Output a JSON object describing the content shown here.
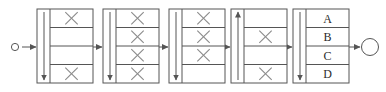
{
  "diagram": {
    "type": "linked-list-pipeline",
    "title": "",
    "canvas": {
      "width": 386,
      "height": 92
    },
    "colors": {
      "stroke": "#555555",
      "mark": "#8a8a8a",
      "background": "#ffffff",
      "text": "#2b2b2b"
    },
    "start_node": {
      "name": "start-circle",
      "label": "",
      "shape": "circle",
      "cx": 15,
      "cy": 47,
      "r": 3.6
    },
    "end_node": {
      "name": "end-circle",
      "label": "",
      "shape": "circle",
      "cx": 370,
      "cy": 47,
      "r": 8.5
    },
    "boxes": [
      {
        "id": "box-1",
        "index": 1,
        "x": 37,
        "y": 9,
        "width": 56,
        "height": 74,
        "bar": {
          "direction": "down",
          "arrow": true
        },
        "cells": [
          {
            "row": 1,
            "label": "",
            "mark": "x"
          },
          {
            "row": 2,
            "label": "",
            "mark": ""
          },
          {
            "row": 3,
            "label": "",
            "mark": ""
          },
          {
            "row": 4,
            "label": "",
            "mark": "x"
          }
        ]
      },
      {
        "id": "box-2",
        "index": 2,
        "x": 103,
        "y": 9,
        "width": 56,
        "height": 74,
        "bar": {
          "direction": "down",
          "arrow": true
        },
        "cells": [
          {
            "row": 1,
            "label": "",
            "mark": "x"
          },
          {
            "row": 2,
            "label": "",
            "mark": "x"
          },
          {
            "row": 3,
            "label": "",
            "mark": "x"
          },
          {
            "row": 4,
            "label": "",
            "mark": "x"
          }
        ]
      },
      {
        "id": "box-3",
        "index": 3,
        "x": 169,
        "y": 9,
        "width": 56,
        "height": 74,
        "bar": {
          "direction": "down",
          "arrow": true
        },
        "cells": [
          {
            "row": 1,
            "label": "",
            "mark": "x"
          },
          {
            "row": 2,
            "label": "",
            "mark": "x"
          },
          {
            "row": 3,
            "label": "",
            "mark": "x"
          },
          {
            "row": 4,
            "label": "",
            "mark": ""
          }
        ]
      },
      {
        "id": "box-4",
        "index": 4,
        "x": 231,
        "y": 9,
        "width": 56,
        "height": 74,
        "bar": {
          "direction": "up",
          "arrow": true
        },
        "cells": [
          {
            "row": 1,
            "label": "",
            "mark": ""
          },
          {
            "row": 2,
            "label": "",
            "mark": "x"
          },
          {
            "row": 3,
            "label": "",
            "mark": ""
          },
          {
            "row": 4,
            "label": "",
            "mark": "x"
          }
        ]
      },
      {
        "id": "box-5",
        "index": 5,
        "x": 293,
        "y": 9,
        "width": 56,
        "height": 74,
        "bar": {
          "direction": "down",
          "arrow": true
        },
        "cells": [
          {
            "row": 1,
            "label": "A",
            "mark": ""
          },
          {
            "row": 2,
            "label": "B",
            "mark": ""
          },
          {
            "row": 3,
            "label": "C",
            "mark": ""
          },
          {
            "row": 4,
            "label": "D",
            "mark": ""
          }
        ]
      }
    ],
    "connectors": [
      {
        "id": "conn-0",
        "from": "start-circle",
        "to": "box-1",
        "x1": 22,
        "x2": 36,
        "y": 47,
        "arrowhead": true
      },
      {
        "id": "conn-1",
        "from": "box-1",
        "to": "box-2",
        "x1": 93,
        "x2": 102,
        "y": 47,
        "arrowhead": true
      },
      {
        "id": "conn-2",
        "from": "box-2",
        "to": "box-3",
        "x1": 159,
        "x2": 168,
        "y": 47,
        "arrowhead": true
      },
      {
        "id": "conn-3",
        "from": "box-3",
        "to": "box-4",
        "x1": 225,
        "x2": 230,
        "y": 47,
        "arrowhead": true
      },
      {
        "id": "conn-4",
        "from": "box-4",
        "to": "box-5",
        "x1": 287,
        "x2": 292,
        "y": 47,
        "arrowhead": true
      },
      {
        "id": "conn-5",
        "from": "box-5",
        "to": "end-circle",
        "x1": 349,
        "x2": 360,
        "y": 47,
        "arrowhead": true
      }
    ]
  }
}
